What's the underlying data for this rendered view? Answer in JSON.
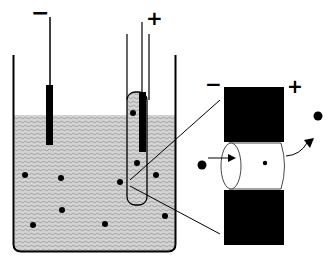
{
  "diagram": {
    "beaker": {
      "left_electrode_label": "−",
      "right_electrode_label": "+"
    },
    "magnified_view": {
      "negative_label": "−",
      "positive_label": "+"
    },
    "colors": {
      "ink": "#000000",
      "liquid": "#c8c8c8",
      "background": "#ffffff"
    }
  }
}
